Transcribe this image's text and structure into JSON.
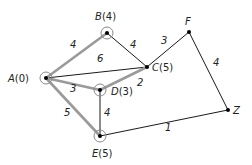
{
  "diagram": {
    "type": "weighted-graph",
    "colors": {
      "thin_edge": "#1a1a1a",
      "highlight_edge": "#9a9a9a",
      "node_dot": "#000000",
      "ring": "#8a8a8a"
    },
    "nodes": [
      {
        "id": "A",
        "name": "A",
        "value": "0",
        "x": 46,
        "y": 78,
        "ring": true,
        "label_x": 8,
        "label_y": 82
      },
      {
        "id": "B",
        "name": "B",
        "value": "4",
        "x": 107,
        "y": 33,
        "ring": true,
        "label_x": 95,
        "label_y": 20
      },
      {
        "id": "C",
        "name": "C",
        "value": "5",
        "x": 147,
        "y": 67,
        "ring": false,
        "label_x": 152,
        "label_y": 71
      },
      {
        "id": "D",
        "name": "D",
        "value": "3",
        "x": 100,
        "y": 90,
        "ring": true,
        "label_x": 111,
        "label_y": 95
      },
      {
        "id": "E",
        "name": "E",
        "value": "5",
        "x": 100,
        "y": 136,
        "ring": true,
        "label_x": 92,
        "label_y": 157
      },
      {
        "id": "F",
        "name": "F",
        "value": "",
        "x": 189,
        "y": 32,
        "ring": false,
        "label_x": 185,
        "label_y": 25
      },
      {
        "id": "Z",
        "name": "Z",
        "value": "",
        "x": 228,
        "y": 110,
        "ring": false,
        "label_x": 233,
        "label_y": 114
      }
    ],
    "edges": [
      {
        "from": "A",
        "to": "B",
        "weight": "4",
        "highlight": true,
        "label_x": 70,
        "label_y": 48
      },
      {
        "from": "A",
        "to": "C",
        "weight": "6",
        "highlight": false,
        "label_x": 97,
        "label_y": 62
      },
      {
        "from": "A",
        "to": "D",
        "weight": "3",
        "highlight": true,
        "label_x": 70,
        "label_y": 92
      },
      {
        "from": "A",
        "to": "E",
        "weight": "5",
        "highlight": true,
        "label_x": 64,
        "label_y": 116
      },
      {
        "from": "B",
        "to": "C",
        "weight": "4",
        "highlight": false,
        "label_x": 130,
        "label_y": 48
      },
      {
        "from": "C",
        "to": "D",
        "weight": "2",
        "highlight": true,
        "label_x": 137,
        "label_y": 86
      },
      {
        "from": "D",
        "to": "E",
        "weight": "4",
        "highlight": false,
        "label_x": 104,
        "label_y": 116
      },
      {
        "from": "C",
        "to": "F",
        "weight": "3",
        "highlight": false,
        "label_x": 161,
        "label_y": 44
      },
      {
        "from": "F",
        "to": "Z",
        "weight": "4",
        "highlight": false,
        "label_x": 213,
        "label_y": 66
      },
      {
        "from": "E",
        "to": "Z",
        "weight": "1",
        "highlight": false,
        "label_x": 165,
        "label_y": 131
      }
    ]
  }
}
